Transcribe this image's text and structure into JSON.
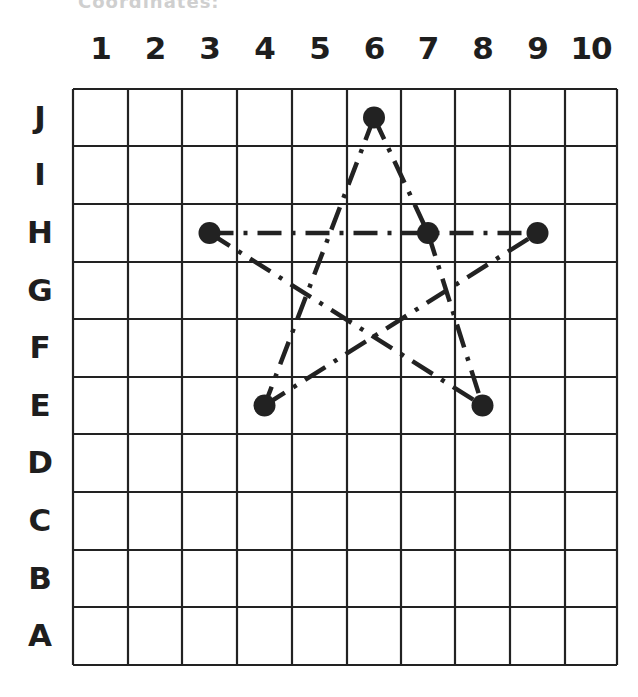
{
  "header": {
    "cut_off_text": "Coordinates:"
  },
  "grid": {
    "columns": [
      "1",
      "2",
      "3",
      "4",
      "5",
      "6",
      "7",
      "8",
      "9",
      "10"
    ],
    "rows_top_to_bottom": [
      "J",
      "I",
      "H",
      "G",
      "F",
      "E",
      "D",
      "C",
      "B",
      "A"
    ],
    "line_color": "#222222",
    "point_color": "#222222"
  },
  "points": [
    {
      "label": "J6",
      "row": "J",
      "col": 6
    },
    {
      "label": "H3",
      "row": "H",
      "col": 3
    },
    {
      "label": "H7",
      "row": "H",
      "col": 7
    },
    {
      "label": "H9",
      "row": "H",
      "col": 9
    },
    {
      "label": "E4",
      "row": "E",
      "col": 4
    },
    {
      "label": "E8",
      "row": "E",
      "col": 8
    }
  ],
  "segments": [
    {
      "from": "J6",
      "to": "E4",
      "style": "dash-dot"
    },
    {
      "from": "J6",
      "to": "H7",
      "style": "dash-dot"
    },
    {
      "from": "H7",
      "to": "E8",
      "style": "dash-dot"
    },
    {
      "from": "H3",
      "to": "H9",
      "style": "dash-dot"
    },
    {
      "from": "H3",
      "to": "E8",
      "style": "dash-dot"
    },
    {
      "from": "E4",
      "to": "H9",
      "style": "dash-dot"
    }
  ],
  "shape": "five-pointed star"
}
